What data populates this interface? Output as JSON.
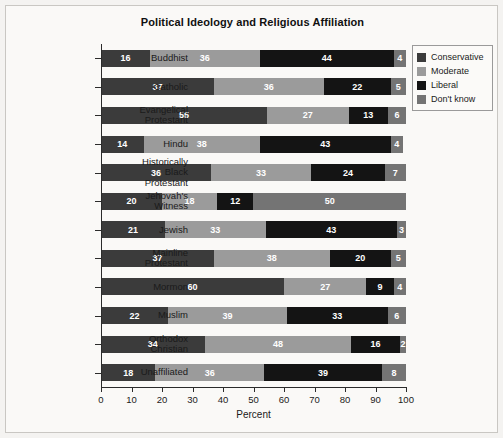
{
  "chart_data": {
    "type": "bar",
    "orientation": "horizontal",
    "stacked": true,
    "percent_stacked": true,
    "title": "Political Ideology and Religious Affiliation",
    "xlabel": "Percent",
    "ylabel": "",
    "xlim": [
      0,
      100
    ],
    "xticks": [
      0,
      10,
      20,
      30,
      40,
      50,
      60,
      70,
      80,
      90,
      100
    ],
    "xticklabels": [
      "0",
      "10",
      "20",
      "30",
      "40",
      "50",
      "60",
      "70",
      "80",
      "90",
      "100"
    ],
    "grid": false,
    "legend_position": "right",
    "categories": [
      "Buddhist",
      "Catholic",
      "Evangelical Protestant",
      "Hindu",
      "Historically Black Protestant",
      "Jehovah's Witness",
      "Jewish",
      "Mainline Protestant",
      "Mormon",
      "Muslim",
      "Orthodox Christian",
      "Unaffiliated"
    ],
    "category_label_lines": [
      [
        "Buddhist"
      ],
      [
        "Catholic"
      ],
      [
        "Evangelical",
        "Protestant"
      ],
      [
        "Hindu"
      ],
      [
        "Historically",
        "Black",
        "Protestant"
      ],
      [
        "Jehovah's",
        "Witness"
      ],
      [
        "Jewish"
      ],
      [
        "Mainline",
        "Protestant"
      ],
      [
        "Mormon"
      ],
      [
        "Muslim"
      ],
      [
        "Orthodox",
        "Christian"
      ],
      [
        "Unaffiliated"
      ]
    ],
    "series": [
      {
        "name": "Conservative",
        "color": "#3b3b3b",
        "values": [
          16,
          37,
          55,
          14,
          36,
          20,
          21,
          37,
          60,
          22,
          34,
          18
        ]
      },
      {
        "name": "Moderate",
        "color": "#9b9b9b",
        "values": [
          36,
          36,
          27,
          38,
          33,
          18,
          33,
          38,
          27,
          39,
          48,
          36
        ]
      },
      {
        "name": "Liberal",
        "color": "#141414",
        "values": [
          44,
          22,
          13,
          43,
          24,
          12,
          43,
          20,
          9,
          33,
          16,
          39
        ]
      },
      {
        "name": "Don't know",
        "color": "#747474",
        "values": [
          4,
          5,
          6,
          4,
          7,
          50,
          3,
          5,
          4,
          6,
          2,
          8
        ]
      }
    ]
  },
  "legend": {
    "items": [
      {
        "label": "Conservative",
        "color": "#3b3b3b"
      },
      {
        "label": "Moderate",
        "color": "#9b9b9b"
      },
      {
        "label": "Liberal",
        "color": "#141414"
      },
      {
        "label": "Don't know",
        "color": "#747474"
      }
    ]
  }
}
